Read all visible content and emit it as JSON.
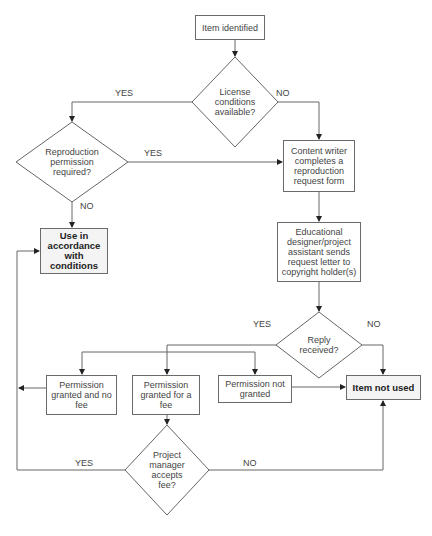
{
  "flowchart": {
    "nodes": {
      "item_identified": "Item identified",
      "license_conditions": "License conditions available?",
      "reproduction_permission": "Reproduction permission required?",
      "use_in_accordance": "Use in accordance with conditions",
      "content_writer": "Content writer completes a reproduction request form",
      "educational_designer": "Educational designer/project assistant sends request letter to copyright holder(s)",
      "reply_received": "Reply received?",
      "permission_no_fee": "Permission granted and no fee",
      "permission_fee": "Permission granted for a fee",
      "permission_not_granted": "Permission not granted",
      "item_not_used": "Item not used",
      "pm_accepts_fee": "Project manager accepts fee?"
    },
    "edge_labels": {
      "license_yes": "YES",
      "license_no": "NO",
      "repro_yes": "YES",
      "repro_no": "NO",
      "reply_yes": "YES",
      "reply_no": "NO",
      "pm_yes": "YES",
      "pm_no": "NO"
    },
    "colors": {
      "line": "#555555",
      "terminal_fill": "#f4f4f4"
    }
  }
}
